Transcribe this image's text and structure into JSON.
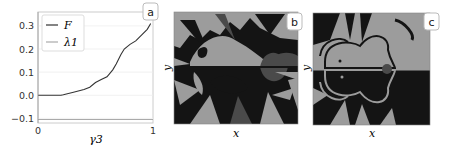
{
  "chart_data": [
    {
      "panel": "a",
      "type": "line",
      "xlabel": "γ3",
      "ylabel": "",
      "xlim": [
        0,
        1
      ],
      "ylim": [
        -0.12,
        0.36
      ],
      "xticks": [
        "0",
        "1"
      ],
      "yticks": [
        "-0.1",
        "0.0",
        "0.1",
        "0.2",
        "0.3"
      ],
      "grid": true,
      "legend_position": "upper left",
      "series": [
        {
          "name": "F",
          "color": "#333333",
          "x": [
            0,
            0.1,
            0.2,
            0.22,
            0.3,
            0.4,
            0.45,
            0.5,
            0.55,
            0.6,
            0.65,
            0.68,
            0.72,
            0.75,
            0.8,
            0.85,
            0.9,
            0.95,
            0.98
          ],
          "y": [
            0,
            0,
            0,
            0.002,
            0.012,
            0.025,
            0.035,
            0.055,
            0.068,
            0.08,
            0.11,
            0.135,
            0.175,
            0.2,
            0.22,
            0.235,
            0.26,
            0.285,
            0.31
          ]
        },
        {
          "name": "λ1",
          "color": "#aaaaaa",
          "x": [
            0,
            1
          ],
          "y": [
            -0.105,
            -0.105
          ]
        }
      ]
    },
    {
      "panel": "b",
      "type": "heatmap",
      "xlabel": "x",
      "ylabel": "y",
      "description": "Basin-of-attraction style 3-tone map (black, dark gray, light gray) with fractal filament boundaries"
    },
    {
      "panel": "c",
      "type": "heatmap",
      "xlabel": "x",
      "ylabel": "y",
      "description": "Basin-of-attraction style 2-tone map (black, light gray) with a small dark-gray disk near center-right"
    }
  ],
  "panels": {
    "a": {
      "label": "a"
    },
    "b": {
      "label": "b"
    },
    "c": {
      "label": "c"
    }
  },
  "colors": {
    "black": "#141414",
    "dark_gray": "#4a4a4a",
    "light_gray": "#9c9c9c"
  }
}
